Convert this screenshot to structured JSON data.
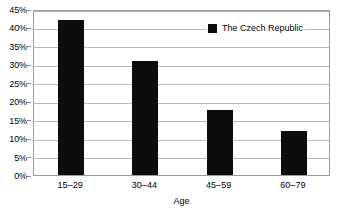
{
  "chart_data": {
    "type": "bar",
    "title": "",
    "categories": [
      "15–29",
      "30–44",
      "45–59",
      "60–79"
    ],
    "values": [
      42,
      31,
      17.5,
      12
    ],
    "series": [
      {
        "name": "The Czech Republic",
        "color": "#0d0d0d",
        "values": [
          42,
          31,
          17.5,
          12
        ]
      }
    ],
    "xlabel": "Age",
    "ylabel": "",
    "ylim": [
      0,
      45
    ],
    "ytick_values": [
      0,
      5,
      10,
      15,
      20,
      25,
      30,
      35,
      40,
      45
    ],
    "ytick_labels": [
      "0%",
      "5%",
      "10%",
      "15%",
      "20%",
      "25%",
      "30%",
      "35%",
      "40%",
      "45%"
    ],
    "grid": true,
    "grid_axis": "y",
    "legend_position": "top-center-inside",
    "value_format": "percent"
  },
  "legend": {
    "entries": [
      {
        "label": "The Czech Republic",
        "color": "#0d0d0d",
        "marker": "square"
      }
    ]
  },
  "colors": {
    "bar": "#0d0d0d",
    "grid": "#b8b8b8",
    "frame": "#9a9a9a",
    "text": "#000000",
    "background": "#ffffff"
  }
}
